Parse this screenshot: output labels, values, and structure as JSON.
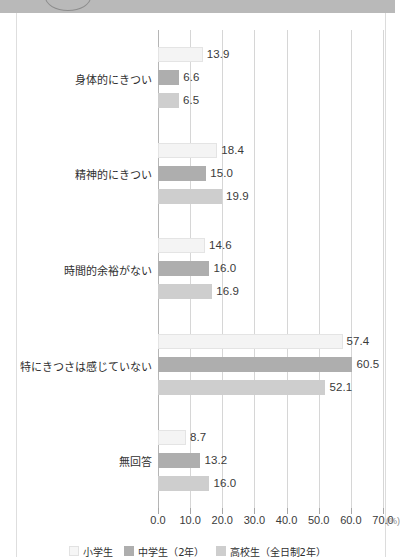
{
  "page": {
    "header_band_color": "#b9b9b9",
    "background_color": "#ffffff"
  },
  "chart_data": {
    "type": "bar",
    "orientation": "horizontal",
    "title": "",
    "xlabel": "(%)",
    "ylabel": "",
    "xlim": [
      0.0,
      70.0
    ],
    "xticks": [
      "0.0",
      "10.0",
      "20.0",
      "30.0",
      "40.0",
      "50.0",
      "60.0",
      "70.0"
    ],
    "xtick_values": [
      0,
      10,
      20,
      30,
      40,
      50,
      60,
      70
    ],
    "grid": true,
    "legend_position": "bottom-center",
    "categories": [
      "身体的にきつい",
      "精神的にきつい",
      "時間的余裕がない",
      "特にきつさは感じていない",
      "無回答"
    ],
    "series": [
      {
        "name": "小学生",
        "color": "#f4f4f4",
        "values": [
          13.9,
          18.4,
          14.6,
          57.4,
          8.7
        ],
        "labels": [
          "13.9",
          "18.4",
          "14.6",
          "57.4",
          "8.7"
        ]
      },
      {
        "name": "中学生（2年）",
        "color": "#aeaeae",
        "values": [
          6.6,
          15.0,
          16.0,
          60.5,
          13.2
        ],
        "labels": [
          "6.6",
          "15.0",
          "16.0",
          "60.5",
          "13.2"
        ]
      },
      {
        "name": "高校生（全日制2年）",
        "color": "#cecece",
        "values": [
          6.5,
          19.9,
          16.9,
          52.1,
          16.0
        ],
        "labels": [
          "6.5",
          "19.9",
          "16.9",
          "52.1",
          "16.0"
        ]
      }
    ]
  },
  "legend": {
    "items": [
      {
        "label": "小学生",
        "swatch": "s0"
      },
      {
        "label": "中学生（2年）",
        "swatch": "s1"
      },
      {
        "label": "高校生（全日制2年）",
        "swatch": "s2"
      }
    ]
  }
}
